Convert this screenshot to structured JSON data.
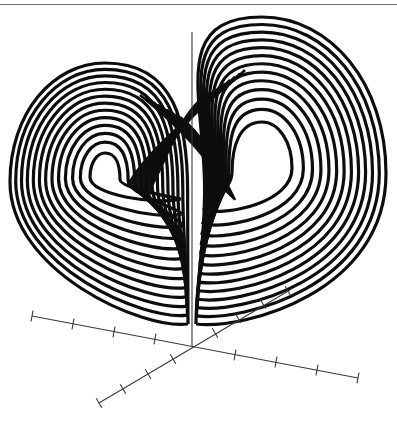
{
  "chart_data": {
    "type": "line",
    "subtype": "3d-parametric-trajectory",
    "title": "Lorenz attractor",
    "xlabel": "",
    "ylabel": "",
    "zlabel": "",
    "grid": false,
    "legend": null,
    "series": [
      {
        "name": "trajectory",
        "color": "#0d0d0d",
        "stroke_width": 3.2,
        "lobes": [
          {
            "name": "left-lobe",
            "hole_center": [
              105,
              176
            ],
            "hole_radius": [
              15,
              23
            ],
            "outer_left": 10,
            "outer_top": 63,
            "loops": 13
          },
          {
            "name": "right-lobe",
            "hole_center": [
              262,
              166
            ],
            "hole_radius": [
              30,
              44
            ],
            "outer_right": 386,
            "outer_top": 17,
            "loops": 13
          }
        ],
        "bottom_cusp": [
          192,
          326
        ]
      }
    ],
    "axes": {
      "color": "#3a3a3a",
      "origin": [
        192,
        347
      ],
      "vertical_axis": {
        "from": [
          192,
          347
        ],
        "to": [
          192,
          32
        ]
      },
      "horizontal_axis": {
        "from": [
          32,
          316
        ],
        "to": [
          358,
          378
        ],
        "ticks": [
          [
            32,
            316
          ],
          [
            73,
            324
          ],
          [
            114,
            332
          ],
          [
            155,
            339
          ],
          [
            235,
            355
          ],
          [
            276,
            362
          ],
          [
            317,
            370
          ],
          [
            358,
            378
          ]
        ]
      },
      "depth_axis": {
        "from": [
          99,
          403
        ],
        "to": [
          290,
          290
        ],
        "ticks": [
          [
            99,
            403
          ],
          [
            123,
            389
          ],
          [
            148,
            374
          ],
          [
            173,
            359
          ],
          [
            215,
            333
          ],
          [
            238,
            318
          ],
          [
            263,
            304
          ],
          [
            288,
            291
          ]
        ]
      },
      "tick_labels": []
    }
  }
}
